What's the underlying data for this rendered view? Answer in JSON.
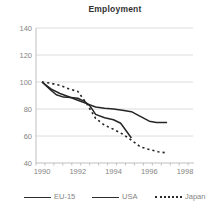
{
  "chart_data": {
    "type": "line",
    "title": "Employment",
    "xlabel": "",
    "ylabel": "",
    "x_ticks": [
      1990,
      1992,
      1994,
      1996,
      1998
    ],
    "y_ticks": [
      140,
      120,
      100,
      80,
      60,
      40
    ],
    "xlim": [
      1989.66,
      1998.45
    ],
    "ylim": [
      40,
      140
    ],
    "grid": true,
    "legend_position": "bottom",
    "colors": {
      "series_stroke": "#252525",
      "grid": "#dcdcdc",
      "axis": "#bfbfbf",
      "tick_text": "#848484",
      "title_text": "#333333"
    },
    "series": [
      {
        "name": "EU-15",
        "style": "solid",
        "points": [
          [
            1990,
            100
          ],
          [
            1990.5,
            95
          ],
          [
            1991,
            91.5
          ],
          [
            1991.5,
            89
          ],
          [
            1992,
            86.5
          ],
          [
            1992.5,
            84
          ],
          [
            1993,
            81.5
          ],
          [
            1993.5,
            80.5
          ],
          [
            1994,
            80
          ],
          [
            1994.5,
            79
          ],
          [
            1995,
            78
          ],
          [
            1995.5,
            74.5
          ],
          [
            1996,
            71
          ],
          [
            1996.4,
            70
          ],
          [
            1997,
            70
          ]
        ]
      },
      {
        "name": "USA",
        "style": "solid",
        "points": [
          [
            1990,
            100
          ],
          [
            1990.5,
            94
          ],
          [
            1990.8,
            90.5
          ],
          [
            1991.2,
            88.8
          ],
          [
            1991.6,
            88.5
          ],
          [
            1992,
            88
          ],
          [
            1992.4,
            85.5
          ],
          [
            1992.7,
            82
          ],
          [
            1993,
            76
          ],
          [
            1993.5,
            73.5
          ],
          [
            1994,
            72
          ],
          [
            1994.4,
            69.5
          ],
          [
            1995,
            58.5
          ]
        ]
      },
      {
        "name": "Japan",
        "style": "dashed",
        "points": [
          [
            1990,
            100
          ],
          [
            1990.5,
            99
          ],
          [
            1991,
            97.5
          ],
          [
            1991.5,
            95
          ],
          [
            1992,
            93
          ],
          [
            1992.5,
            84
          ],
          [
            1993,
            73
          ],
          [
            1993.5,
            68
          ],
          [
            1994,
            65
          ],
          [
            1994.5,
            61.5
          ],
          [
            1995,
            57
          ],
          [
            1995.5,
            52
          ],
          [
            1996,
            50
          ],
          [
            1996.5,
            48.3
          ],
          [
            1997,
            47.5
          ]
        ]
      }
    ]
  }
}
